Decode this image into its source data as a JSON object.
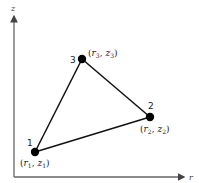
{
  "diagram": {
    "type": "triangular-element",
    "axes": {
      "vertical": {
        "label": "z"
      },
      "horizontal": {
        "label": "r"
      }
    },
    "nodes": [
      {
        "id": "1",
        "coord_label": "(r1, z1)",
        "r_sub": "1",
        "z_sub": "1"
      },
      {
        "id": "2",
        "coord_label": "(r2, z2)",
        "r_sub": "2",
        "z_sub": "2"
      },
      {
        "id": "3",
        "coord_label": "(r3, z3)",
        "r_sub": "3",
        "z_sub": "3"
      }
    ],
    "colors": {
      "line": "#111111",
      "axis": "#555555",
      "node": "#000000"
    }
  }
}
